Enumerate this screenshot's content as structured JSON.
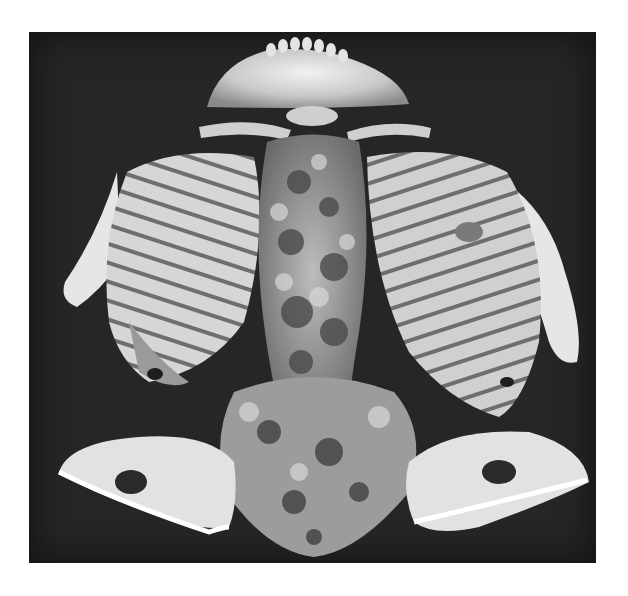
{
  "image": {
    "subject": "3D CT volume rendering of a skeleton (skull base/mandible, clavicles, scapulae, rib cages, spine, pelvis) viewed from above",
    "mode": "grayscale",
    "colors": {
      "background": "#ffffff",
      "frame": "#262626",
      "bone_light": "#e8e8e8",
      "bone_mid": "#b5b5b5",
      "bone_dark": "#6e6e6e",
      "lesion": "#2a2a2a"
    },
    "frame_bounds": {
      "x": 29,
      "y": 32,
      "width": 567,
      "height": 531
    }
  }
}
